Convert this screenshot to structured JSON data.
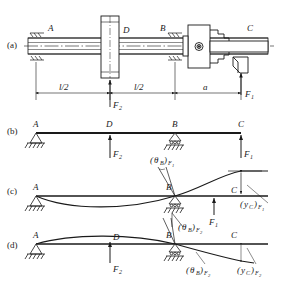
{
  "figure": {
    "background_color": "#ffffff",
    "line_color": "#1a1a1a"
  },
  "panels": [
    {
      "key": "a",
      "label": "(a)",
      "caption": "Lathe spindle assembly",
      "points": [
        "A",
        "D",
        "B",
        "C"
      ],
      "dimensions": [
        "l/2",
        "l/2",
        "a"
      ],
      "forces": [
        "F",
        "F"
      ],
      "force_labels": [
        {
          "name": "F2",
          "base": "F",
          "sub": "2"
        },
        {
          "name": "F1",
          "base": "F",
          "sub": "1"
        }
      ]
    },
    {
      "key": "b",
      "label": "(b)",
      "caption": "Free body beam model",
      "points": [
        "A",
        "D",
        "B",
        "C"
      ],
      "supports": [
        "pin",
        "roller"
      ],
      "forces": [
        {
          "name": "F2",
          "base": "F",
          "sub": "2"
        },
        {
          "name": "F1",
          "base": "F",
          "sub": "1"
        }
      ]
    },
    {
      "key": "c",
      "label": "(c)",
      "caption": "Deflection due to F1",
      "points": [
        "A",
        "B",
        "C"
      ],
      "annotations": [
        {
          "name": "theta-B-F1",
          "base": "θ",
          "base_sub": "B",
          "outer_sub": "F",
          "outer_subsub": "1",
          "text": "(θB)F1"
        },
        {
          "name": "y-C-F1",
          "base": "y",
          "base_sub": "C",
          "outer_sub": "F",
          "outer_subsub": "1",
          "text": "(yC)F1"
        }
      ],
      "force": {
        "name": "F1",
        "base": "F",
        "sub": "1"
      }
    },
    {
      "key": "d",
      "label": "(d)",
      "caption": "Deflection due to F2",
      "points": [
        "A",
        "D",
        "B",
        "C"
      ],
      "annotations": [
        {
          "name": "theta-B-F2-upper",
          "base": "θ",
          "base_sub": "B",
          "outer_sub": "F",
          "outer_subsub": "2",
          "text": "(θB)F2"
        },
        {
          "name": "theta-B-F2-lower",
          "base": "θ",
          "base_sub": "B",
          "outer_sub": "F",
          "outer_subsub": "2",
          "text": "(θB)F2"
        },
        {
          "name": "y-C-F2",
          "base": "y",
          "base_sub": "C",
          "outer_sub": "F",
          "outer_subsub": "2",
          "text": "(yC)F2"
        }
      ],
      "force": {
        "name": "F2",
        "base": "F",
        "sub": "2"
      }
    }
  ],
  "letters": {
    "A": "A",
    "B": "B",
    "C": "C",
    "D": "D",
    "F": "F",
    "y": "y",
    "theta": "θ",
    "one": "1",
    "two": "2",
    "l_over_2": "l/2",
    "a": "a",
    "paren_open": "(",
    "paren_close": ")"
  }
}
